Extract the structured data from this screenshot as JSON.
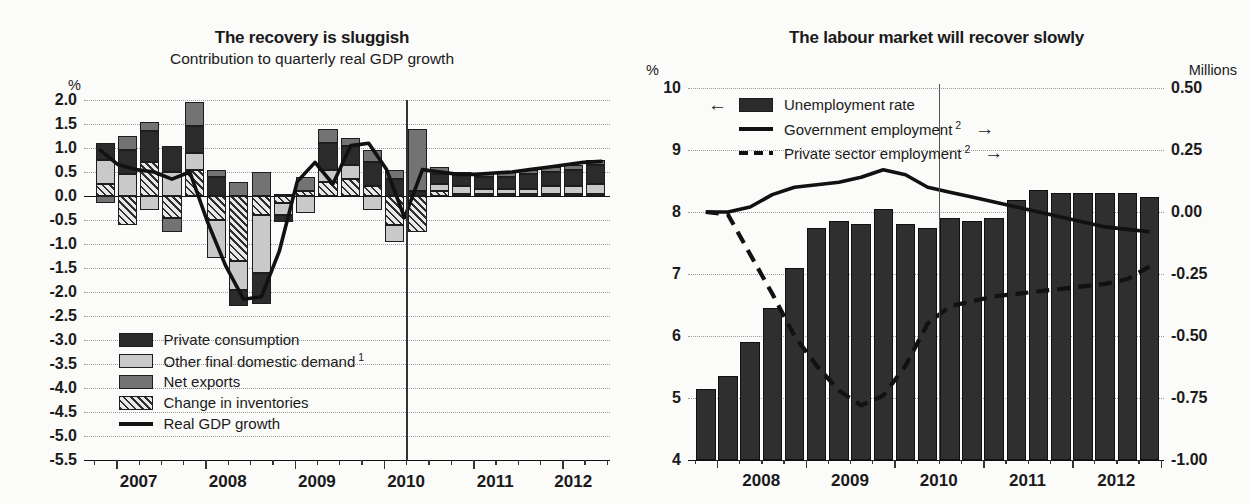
{
  "figure": {
    "background": "#fbfbf9",
    "forecast_marker_note": "vertical line marks start of projection (mid-2010)"
  },
  "left_panel": {
    "title": "The recovery is sluggish",
    "subtitle": "Contribution to quarterly real GDP growth",
    "unit_label": "%",
    "legend": [
      {
        "label": "Private consumption",
        "key": "swatch-dark",
        "color": "#2b2b2b"
      },
      {
        "label": "Other final domestic demand",
        "footnote": "1",
        "key": "swatch-light",
        "color": "#c9c9c9"
      },
      {
        "label": "Net exports",
        "key": "swatch-mid",
        "color": "#737373"
      },
      {
        "label": "Change in inventories",
        "key": "swatch-hatch",
        "color": "#2e2e2e"
      },
      {
        "label": "Real GDP growth",
        "key": "line-solid",
        "color": "#111111"
      }
    ]
  },
  "right_panel": {
    "title": "The labour market will recover slowly",
    "unit_label_left": "%",
    "unit_label_right": "Millions",
    "legend": [
      {
        "label": "Unemployment rate",
        "key": "swatch-dark",
        "arrow": "←",
        "arrow_side": "left",
        "axis": "left",
        "color": "#2f2f2f"
      },
      {
        "label": "Government employment",
        "footnote": "2",
        "key": "line-solid",
        "arrow": "→",
        "arrow_side": "right",
        "axis": "right",
        "color": "#111111"
      },
      {
        "label": "Private sector employment",
        "footnote": "2",
        "key": "line-dash",
        "arrow": "→",
        "arrow_side": "right",
        "axis": "right",
        "color": "#111111"
      }
    ]
  },
  "chart_data": [
    {
      "id": "recovery-is-sluggish",
      "type": "bar",
      "subtype": "stacked-bar-with-line",
      "title": "The recovery is sluggish",
      "subtitle": "Contribution to quarterly real GDP growth",
      "xlabel": "",
      "ylabel": "%",
      "ylim": [
        -5.5,
        2.0
      ],
      "ytick_step": 0.5,
      "ytick_labels": [
        "2.0",
        "1.5",
        "1.0",
        "0.5",
        "0.0",
        "-0.5",
        "-1.0",
        "-1.5",
        "-2.0",
        "-2.5",
        "-3.0",
        "-3.5",
        "-4.0",
        "-4.5",
        "-5.0",
        "-5.5"
      ],
      "grid": true,
      "legend_position": "inside-lower-left",
      "x_axis_year_labels": [
        "2007",
        "2008",
        "2009",
        "2010",
        "2011",
        "2012"
      ],
      "x": [
        "2007Q1",
        "2007Q2",
        "2007Q3",
        "2007Q4",
        "2008Q1",
        "2008Q2",
        "2008Q3",
        "2008Q4",
        "2009Q1",
        "2009Q2",
        "2009Q3",
        "2009Q4",
        "2010Q1",
        "2010Q2",
        "2010Q3",
        "2010Q4",
        "2011Q1",
        "2011Q2",
        "2011Q3",
        "2011Q4",
        "2012Q1",
        "2012Q2",
        "2012Q3"
      ],
      "series": [
        {
          "name": "Private consumption",
          "values": [
            0.35,
            0.5,
            0.65,
            0.55,
            0.55,
            0.4,
            -0.35,
            -0.65,
            -0.15,
            0.0,
            0.55,
            0.4,
            0.5,
            0.35,
            0.1,
            0.2,
            0.25,
            0.25,
            0.25,
            0.3,
            0.3,
            0.35,
            0.4
          ]
        },
        {
          "name": "Other final domestic demand",
          "values": [
            0.5,
            0.45,
            -0.3,
            0.5,
            0.35,
            -0.8,
            -0.6,
            -1.2,
            -0.25,
            -0.35,
            0.25,
            0.3,
            -0.3,
            -0.35,
            0.0,
            0.15,
            0.15,
            0.1,
            0.1,
            0.1,
            0.15,
            0.15,
            0.2
          ]
        },
        {
          "name": "Net exports",
          "values": [
            -0.15,
            0.3,
            0.2,
            -0.3,
            0.5,
            0.15,
            0.3,
            0.5,
            0.05,
            0.3,
            0.3,
            0.15,
            0.25,
            0.2,
            1.3,
            0.15,
            0.05,
            0.05,
            0.1,
            0.1,
            0.1,
            0.1,
            0.1
          ]
        },
        {
          "name": "Change in inventories",
          "values": [
            0.25,
            -0.6,
            0.7,
            -0.45,
            0.55,
            -0.5,
            -1.35,
            -0.4,
            -0.15,
            0.1,
            0.3,
            0.35,
            0.2,
            -0.6,
            -0.75,
            0.1,
            0.05,
            0.05,
            0.05,
            0.05,
            0.05,
            0.05,
            0.05
          ]
        }
      ],
      "line_series": {
        "name": "Real GDP growth",
        "values": [
          0.95,
          0.65,
          0.55,
          0.5,
          0.35,
          0.5,
          -0.55,
          -1.45,
          -2.15,
          -2.1,
          -1.15,
          0.3,
          0.7,
          0.25,
          1.05,
          1.1,
          0.55,
          -0.45,
          0.55,
          0.5,
          0.45,
          0.45,
          0.48,
          0.5,
          0.55,
          0.6,
          0.65,
          0.7,
          0.72
        ]
      },
      "forecast_line_x": "2010Q3"
    },
    {
      "id": "labour-market-will-recover-slowly",
      "type": "bar",
      "subtype": "bar-with-two-lines-dual-axis",
      "title": "The labour market will recover slowly",
      "xlabel": "",
      "ylabel_left": "%",
      "ylabel_right": "Millions",
      "ylim_left": [
        4,
        10
      ],
      "ytick_step_left": 1,
      "ytick_labels_left": [
        "10",
        "9",
        "8",
        "7",
        "6",
        "5",
        "4"
      ],
      "ylim_right": [
        -1.0,
        0.5
      ],
      "ytick_step_right": 0.25,
      "ytick_labels_right": [
        "0.50",
        "0.25",
        "0.00",
        "-0.25",
        "-0.50",
        "-0.75",
        "-1.00"
      ],
      "grid": true,
      "legend_position": "inside-top-left",
      "x_axis_year_labels": [
        "2008",
        "2009",
        "2010",
        "2011",
        "2012"
      ],
      "x": [
        "2007Q4",
        "2008Q1",
        "2008Q2",
        "2008Q3",
        "2008Q4",
        "2009Q1",
        "2009Q2",
        "2009Q3",
        "2009Q4",
        "2010Q1",
        "2010Q2",
        "2010Q3",
        "2010Q4",
        "2011Q1",
        "2011Q2",
        "2011Q3",
        "2011Q4",
        "2012Q1",
        "2012Q2",
        "2012Q3",
        "2012Q4"
      ],
      "bar_series": {
        "name": "Unemployment rate",
        "axis": "left",
        "unit": "%",
        "values": [
          5.15,
          5.35,
          5.9,
          6.45,
          7.1,
          7.75,
          7.85,
          7.8,
          8.05,
          7.8,
          7.75,
          7.9,
          7.85,
          7.9,
          8.2,
          8.35,
          8.3,
          8.3,
          8.3,
          8.3,
          8.25
        ]
      },
      "line_series": [
        {
          "name": "Government employment",
          "axis": "right",
          "unit": "Millions",
          "style": "solid",
          "values": [
            0.0,
            0.0,
            0.02,
            0.07,
            0.1,
            0.11,
            0.12,
            0.14,
            0.17,
            0.15,
            0.1,
            0.08,
            0.06,
            0.04,
            0.02,
            0.0,
            -0.02,
            -0.04,
            -0.06,
            -0.07,
            -0.08
          ]
        },
        {
          "name": "Private sector employment",
          "axis": "right",
          "unit": "Millions",
          "style": "dashed",
          "values": [
            0.0,
            -0.01,
            -0.17,
            -0.33,
            -0.5,
            -0.62,
            -0.72,
            -0.78,
            -0.74,
            -0.62,
            -0.45,
            -0.38,
            -0.36,
            -0.34,
            -0.33,
            -0.32,
            -0.31,
            -0.3,
            -0.29,
            -0.27,
            -0.22
          ]
        }
      ],
      "forecast_line_x": "2010Q3"
    }
  ]
}
